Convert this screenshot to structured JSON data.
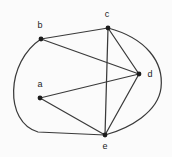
{
  "figure": {
    "name": "undirected-graph-abcde",
    "background_color": "#fbfbfb",
    "edge_color": "#3a3a3a",
    "node_color": "#1c1c1c",
    "width": 172,
    "height": 157
  },
  "graph": {
    "type": "undirected-graph",
    "nodes": [
      {
        "id": "a",
        "label": "a",
        "x": 40,
        "y": 98,
        "label_x": 40,
        "label_y": 85
      },
      {
        "id": "b",
        "label": "b",
        "x": 41,
        "y": 39,
        "label_x": 40,
        "label_y": 26
      },
      {
        "id": "c",
        "label": "c",
        "x": 108,
        "y": 28,
        "label_x": 107,
        "label_y": 15
      },
      {
        "id": "d",
        "label": "d",
        "x": 139,
        "y": 74,
        "label_x": 150,
        "label_y": 75
      },
      {
        "id": "e",
        "label": "e",
        "x": 105,
        "y": 135,
        "label_x": 105,
        "label_y": 147
      }
    ],
    "edges": [
      {
        "from": "b",
        "to": "c",
        "shape": "straight",
        "path": "M 41 39 L 108 28"
      },
      {
        "from": "b",
        "to": "d",
        "shape": "straight",
        "path": "M 41 39 L 139 74"
      },
      {
        "from": "b",
        "to": "e",
        "shape": "curved",
        "path": "M 41 39 C 6 62 4 122 38 132 L 105 135"
      },
      {
        "from": "c",
        "to": "d",
        "shape": "straight",
        "path": "M 108 28 L 139 74"
      },
      {
        "from": "c",
        "to": "e",
        "shape": "straight",
        "path": "M 108 28 L 105 135"
      },
      {
        "from": "c",
        "to": "e",
        "shape": "curved",
        "path": "M 108 28 C 146 38 164 62 161 88 C 158 112 130 128 105 135"
      },
      {
        "from": "a",
        "to": "d",
        "shape": "straight",
        "path": "M 40 98 L 139 74"
      },
      {
        "from": "a",
        "to": "e",
        "shape": "straight",
        "path": "M 40 98 L 105 135"
      },
      {
        "from": "d",
        "to": "e",
        "shape": "straight",
        "path": "M 139 74 L 105 135"
      }
    ]
  }
}
